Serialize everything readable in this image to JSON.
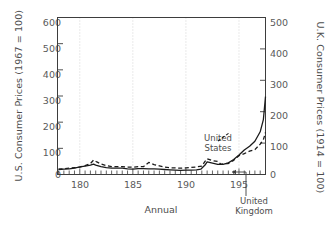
{
  "chart_data": {
    "type": "line",
    "title": "",
    "xlabel": "Annual",
    "y_left_label": "U.S. Consumer Prices (1967 = 100)",
    "y_right_label": "U.K. Consumer Prices (1914 = 100)",
    "xlim": [
      1779,
      1975
    ],
    "ylim_left": [
      0,
      600
    ],
    "ylim_right": [
      0,
      500
    ],
    "x_ticks": [
      1800,
      1850,
      1900,
      1950
    ],
    "x_tick_labels": [
      "180",
      "185",
      "190",
      "195"
    ],
    "x_minor_tick_interval": 5,
    "y_left_ticks": [
      0,
      100,
      200,
      300,
      400,
      500,
      600
    ],
    "y_left_tick_labels": [
      "0",
      "100",
      "200",
      "300",
      "400",
      "500",
      "600"
    ],
    "y_right_ticks": [
      0,
      100,
      200,
      300,
      400,
      500
    ],
    "y_right_tick_labels": [
      "0",
      "100",
      "200",
      "300",
      "400",
      "500"
    ],
    "grid": "vertical-dotted",
    "legend": "annotations-inline",
    "annotations": [
      {
        "name": "united-states",
        "text_line1": "United",
        "text_line2": "States",
        "series": "United States"
      },
      {
        "name": "united-kingdom",
        "text_line1": "United",
        "text_line2": "Kingdom",
        "series": "United Kingdom"
      }
    ],
    "series": [
      {
        "name": "United States",
        "axis": "left",
        "style": "dashed",
        "color": "#1a1a1a",
        "x": [
          1780,
          1785,
          1790,
          1795,
          1800,
          1805,
          1810,
          1813,
          1816,
          1820,
          1825,
          1830,
          1835,
          1840,
          1845,
          1850,
          1855,
          1860,
          1865,
          1870,
          1875,
          1880,
          1885,
          1890,
          1895,
          1900,
          1905,
          1910,
          1915,
          1918,
          1920,
          1925,
          1930,
          1933,
          1935,
          1940,
          1945,
          1950,
          1955,
          1960,
          1965,
          1970,
          1973,
          1975
        ],
        "values": [
          20,
          22,
          24,
          26,
          28,
          34,
          42,
          55,
          48,
          40,
          34,
          30,
          30,
          30,
          28,
          28,
          30,
          30,
          46,
          38,
          33,
          28,
          26,
          25,
          24,
          25,
          27,
          29,
          32,
          50,
          60,
          53,
          50,
          39,
          41,
          42,
          54,
          72,
          80,
          89,
          95,
          116,
          133,
          161
        ]
      },
      {
        "name": "United Kingdom",
        "axis": "right",
        "style": "solid",
        "color": "#1a1a1a",
        "x": [
          1780,
          1785,
          1790,
          1795,
          1800,
          1805,
          1810,
          1813,
          1815,
          1820,
          1825,
          1830,
          1835,
          1840,
          1845,
          1850,
          1855,
          1860,
          1865,
          1870,
          1875,
          1880,
          1885,
          1890,
          1895,
          1900,
          1905,
          1910,
          1914,
          1918,
          1920,
          1925,
          1930,
          1935,
          1940,
          1945,
          1950,
          1955,
          1960,
          1965,
          1970,
          1973,
          1975
        ],
        "values": [
          16,
          17,
          18,
          20,
          24,
          27,
          30,
          33,
          30,
          25,
          22,
          20,
          20,
          20,
          18,
          17,
          19,
          19,
          18,
          18,
          17,
          16,
          15,
          14,
          13,
          14,
          14,
          15,
          17,
          30,
          40,
          36,
          32,
          32,
          37,
          48,
          62,
          78,
          90,
          106,
          136,
          175,
          248
        ]
      }
    ]
  },
  "axes": {
    "left_title": "U.S. Consumer Prices (1967 = 100)",
    "right_title": "U.K. Consumer Prices (1914 = 100)",
    "x_title": "Annual"
  },
  "labels": {
    "y_left": [
      "600",
      "500",
      "400",
      "300",
      "200",
      "100",
      "0"
    ],
    "y_right": [
      "500",
      "400",
      "300",
      "200",
      "100",
      "0"
    ],
    "x": [
      "180",
      "185",
      "190",
      "195"
    ]
  },
  "annotations": {
    "us_line1": "United",
    "us_line2": "States",
    "uk_line1": "United",
    "uk_line2": "Kingdom"
  },
  "colors": {
    "series": "#1a1a1a",
    "frame": "#3d3d3d",
    "grid": "#c9c9c9",
    "text": "#4d4d4d"
  }
}
